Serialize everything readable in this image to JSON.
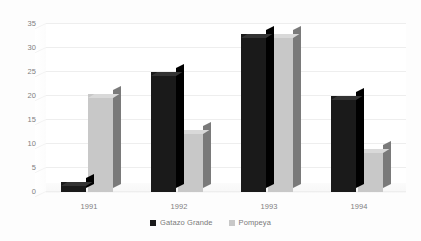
{
  "chart_data": {
    "type": "bar",
    "title": "",
    "subtitle": "",
    "xlabel": "",
    "ylabel": "",
    "categories": [
      "1991",
      "1992",
      "1993",
      "1994"
    ],
    "series": [
      {
        "name": "Gatazo Grande",
        "values": [
          2,
          25,
          33,
          20
        ],
        "color": "#1a1a1a"
      },
      {
        "name": "Pompeya",
        "values": [
          20.5,
          13,
          33,
          9
        ],
        "color": "#c8c8c8"
      }
    ],
    "ylim": [
      0,
      35
    ],
    "ytick_values": [
      0,
      5,
      10,
      15,
      20,
      25,
      30,
      35
    ],
    "ytick_labels": [
      "0",
      "5",
      "10",
      "15",
      "20",
      "25",
      "30",
      "35"
    ],
    "grid": true,
    "grid_axis": "y",
    "legend_position": "bottom-center",
    "style": "3d-clustered-column"
  },
  "axes": {
    "y": {
      "ticks": [
        {
          "label": "35",
          "value": 35
        },
        {
          "label": "30",
          "value": 30
        },
        {
          "label": "25",
          "value": 25
        },
        {
          "label": "20",
          "value": 20
        },
        {
          "label": "15",
          "value": 15
        },
        {
          "label": "10",
          "value": 10
        },
        {
          "label": "5",
          "value": 5
        },
        {
          "label": "0",
          "value": 0
        }
      ]
    },
    "x": {
      "ticks": [
        {
          "label": "1991"
        },
        {
          "label": "1992"
        },
        {
          "label": "1993"
        },
        {
          "label": "1994"
        }
      ]
    }
  },
  "legend": {
    "items": [
      {
        "label": "Gatazo Grande",
        "color": "#1a1a1a"
      },
      {
        "label": "Pompeya",
        "color": "#c8c8c8"
      }
    ]
  },
  "colors": {
    "series_1_front": "#1a1a1a",
    "series_1_side": "#000000",
    "series_1_top": "#333333",
    "series_2_front": "#c8c8c8",
    "series_2_side": "#7a7a7a",
    "series_2_top": "#d9d9d9",
    "gridline": "#eeeeee",
    "tick_text": "#808080",
    "background": "#fdfdfd"
  }
}
